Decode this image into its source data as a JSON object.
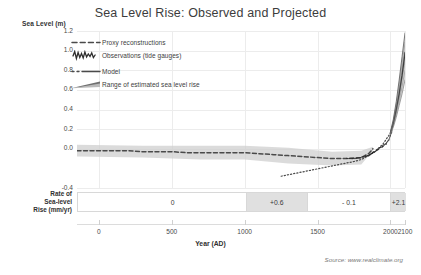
{
  "title": "Sea Level Rise: Observed and Projected",
  "source_note": "Source: www.realclimate.org",
  "axes": {
    "y_title": "Sea Level (m)",
    "x_title": "Year (AD)",
    "y_ticks": [
      "1.2",
      "1.0",
      "0.8",
      "0.6",
      "0.4",
      "0.2",
      "0.0",
      "-0.4"
    ],
    "x_ticks": [
      "0",
      "500",
      "1000",
      "1500",
      "2000",
      "2100"
    ]
  },
  "legend": {
    "items": [
      {
        "label": "Proxy reconstructions",
        "symbol": "dashed-line",
        "color": "#4a4a4a"
      },
      {
        "label": "Observations (tide gauges)",
        "symbol": "jagged-line",
        "color": "#2e2e2e"
      },
      {
        "label": "Model",
        "symbol": "dash-dot-line",
        "color": "#4a4a4a"
      },
      {
        "label": "Range of estimated sea level rise",
        "symbol": "wedge-band",
        "color": "#6f6f6f"
      }
    ]
  },
  "rate_bar": {
    "label_lines": [
      "Rate of",
      "Sea-level",
      "Rise (mm/yr)"
    ],
    "segments": [
      {
        "value": "0",
        "from_year": 0,
        "to_year": 1000,
        "fill": "#ffffff"
      },
      {
        "value": "+0.6",
        "from_year": 1000,
        "to_year": 1420,
        "fill": "#e0e0e0"
      },
      {
        "value": "- 0.1",
        "from_year": 1420,
        "to_year": 1990,
        "fill": "#ffffff"
      },
      {
        "value": "+2.1",
        "from_year": 1990,
        "to_year": 2100,
        "fill": "#e0e0e0"
      }
    ]
  },
  "chart_data": {
    "type": "line",
    "title": "Sea Level Rise: Observed and Projected",
    "xlabel": "Year (AD)",
    "ylabel": "Sea Level (m)",
    "xlim": [
      -150,
      2100
    ],
    "ylim": [
      -0.4,
      1.2
    ],
    "grid": true,
    "legend_position": "upper-left-inside",
    "series": [
      {
        "name": "Proxy reconstructions",
        "style": "dashed",
        "color": "#4a4a4a",
        "x": [
          -150,
          0,
          100,
          200,
          300,
          400,
          500,
          600,
          700,
          800,
          900,
          1000,
          1100,
          1200,
          1300,
          1400,
          1500,
          1600,
          1700,
          1800,
          1850,
          1880
        ],
        "y": [
          -0.02,
          -0.02,
          -0.02,
          -0.02,
          -0.03,
          -0.03,
          -0.03,
          -0.04,
          -0.04,
          -0.04,
          -0.04,
          -0.04,
          -0.05,
          -0.06,
          -0.07,
          -0.08,
          -0.09,
          -0.1,
          -0.1,
          -0.09,
          -0.05,
          0.0
        ]
      },
      {
        "name": "Proxy uncertainty band",
        "style": "band",
        "color": "#cfcfcf",
        "x": [
          -150,
          300,
          700,
          1000,
          1300,
          1600,
          1800,
          1880
        ],
        "y_upper": [
          0.04,
          0.03,
          0.03,
          0.03,
          0.01,
          -0.03,
          -0.02,
          0.02
        ],
        "y_lower": [
          -0.08,
          -0.09,
          -0.11,
          -0.11,
          -0.15,
          -0.17,
          -0.16,
          -0.02
        ]
      },
      {
        "name": "Model",
        "style": "dash-dot",
        "color": "#4a4a4a",
        "x": [
          1250,
          1350,
          1450,
          1550,
          1650,
          1750,
          1800,
          1850,
          1900,
          1950,
          2000
        ],
        "y": [
          -0.28,
          -0.25,
          -0.22,
          -0.19,
          -0.16,
          -0.13,
          -0.11,
          -0.07,
          -0.02,
          0.05,
          0.16
        ]
      },
      {
        "name": "Observations (tide gauges)",
        "style": "jagged",
        "color": "#262626",
        "x": [
          1700,
          1750,
          1800,
          1850,
          1870,
          1900,
          1920,
          1940,
          1950,
          1960,
          1970,
          1980,
          1990,
          2000,
          2010
        ],
        "y": [
          -0.1,
          -0.1,
          -0.09,
          -0.07,
          -0.05,
          -0.02,
          0.0,
          0.02,
          0.03,
          0.04,
          0.05,
          0.07,
          0.09,
          0.13,
          0.18
        ]
      },
      {
        "name": "Projection central",
        "style": "solid",
        "color": "#2e2e2e",
        "x": [
          2000,
          2020,
          2040,
          2060,
          2080,
          2100
        ],
        "y": [
          0.16,
          0.26,
          0.4,
          0.56,
          0.75,
          0.98
        ]
      },
      {
        "name": "Projection upper bound",
        "style": "solid",
        "color": "#555555",
        "x": [
          2000,
          2020,
          2040,
          2060,
          2080,
          2100
        ],
        "y": [
          0.17,
          0.3,
          0.48,
          0.7,
          0.94,
          1.18
        ]
      },
      {
        "name": "Projection lower bound",
        "style": "solid",
        "color": "#8a8a8a",
        "x": [
          2000,
          2020,
          2040,
          2060,
          2080,
          2100
        ],
        "y": [
          0.15,
          0.22,
          0.32,
          0.44,
          0.56,
          0.7
        ]
      },
      {
        "name": "Projection range band",
        "style": "band",
        "color": "#c8c8c8",
        "x": [
          2000,
          2020,
          2040,
          2060,
          2080,
          2100
        ],
        "y_upper": [
          0.17,
          0.3,
          0.48,
          0.7,
          0.94,
          1.18
        ],
        "y_lower": [
          0.15,
          0.22,
          0.32,
          0.44,
          0.56,
          0.7
        ]
      }
    ]
  }
}
